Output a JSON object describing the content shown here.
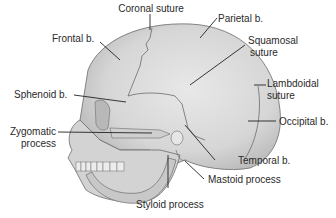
{
  "figure": {
    "colors": {
      "bone": "#d9d9d9",
      "bone_shadow": "#bdbdbd",
      "outline": "#6b6b6b",
      "leader": "#222222",
      "text": "#2a2a2a"
    }
  },
  "labels": {
    "coronal_suture": "Coronal suture",
    "parietal": "Parietal b.",
    "frontal": "Frontal b.",
    "squamosal_1": "Squamosal",
    "squamosal_2": "suture",
    "sphenoid": "Sphenoid b.",
    "lambdoidal_1": "Lambdoidal",
    "lambdoidal_2": "suture",
    "occipital": "Occipital b.",
    "zygomatic_1": "Zygomatic",
    "zygomatic_2": "process",
    "temporal": "Temporal b.",
    "mastoid": "Mastoid process",
    "styloid": "Styloid process"
  }
}
